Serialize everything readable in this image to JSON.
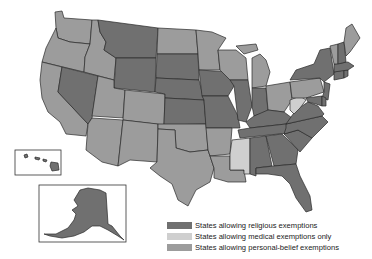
{
  "colors": {
    "religious": "#707070",
    "medical_only": "#cfcfcf",
    "personal_belief": "#9c9c9c",
    "border": "#2a2a2a",
    "background": "#ffffff"
  },
  "legend": [
    {
      "key": "religious",
      "label": "States allowing religious exemptions",
      "color": "#707070"
    },
    {
      "key": "medical_only",
      "label": "States allowing medical exemptions only",
      "color": "#cfcfcf"
    },
    {
      "key": "personal_belief",
      "label": "States allowing personal-belief exemptions",
      "color": "#9c9c9c"
    }
  ],
  "states": {
    "WA": "personal_belief",
    "OR": "personal_belief",
    "CA": "personal_belief",
    "ID": "personal_belief",
    "NV": "religious",
    "MT": "religious",
    "WY": "religious",
    "UT": "personal_belief",
    "CO": "personal_belief",
    "AZ": "personal_belief",
    "NM": "personal_belief",
    "ND": "personal_belief",
    "SD": "religious",
    "NE": "religious",
    "KS": "religious",
    "OK": "personal_belief",
    "TX": "personal_belief",
    "MN": "personal_belief",
    "IA": "religious",
    "MO": "religious",
    "AR": "personal_belief",
    "LA": "personal_belief",
    "WI": "personal_belief",
    "IL": "religious",
    "MI": "personal_belief",
    "IN": "religious",
    "OH": "personal_belief",
    "KY": "religious",
    "TN": "religious",
    "MS": "medical_only",
    "AL": "religious",
    "GA": "religious",
    "FL": "religious",
    "SC": "religious",
    "NC": "religious",
    "VA": "religious",
    "WV": "medical_only",
    "PA": "personal_belief",
    "NY": "religious",
    "NJ": "religious",
    "MD": "religious",
    "DE": "religious",
    "CT": "religious",
    "RI": "religious",
    "MA": "religious",
    "VT": "personal_belief",
    "NH": "religious",
    "ME": "personal_belief",
    "AK": "religious",
    "HI": "religious"
  },
  "insets": [
    {
      "name": "Hawaii"
    },
    {
      "name": "Alaska"
    }
  ]
}
